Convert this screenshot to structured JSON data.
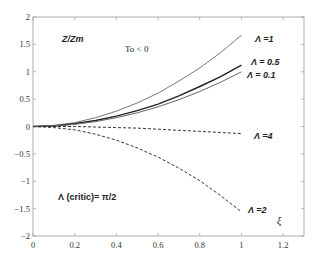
{
  "chart_data": {
    "type": "line",
    "title": "",
    "xlabel": "ξ",
    "ylabel": "Z/Zm",
    "xlim": [
      0,
      1.3
    ],
    "ylim": [
      -2,
      2
    ],
    "xticks": [
      "0",
      "0.2",
      "0.4",
      "0.6",
      "0.8",
      "1",
      "1.2"
    ],
    "yticks": [
      "2",
      "1.5",
      "1",
      "0.5",
      "0",
      "-0.5",
      "-1",
      "-1.5",
      "-2"
    ],
    "grid": false,
    "annotations": [
      "To < 0",
      "Λ (critic)= π/2"
    ],
    "x": [
      0,
      0.1,
      0.2,
      0.3,
      0.4,
      0.5,
      0.6,
      0.7,
      0.8,
      0.9,
      1.0
    ],
    "series": [
      {
        "name": "Λ =1",
        "style": "solid",
        "values": [
          0,
          0.02,
          0.07,
          0.16,
          0.28,
          0.43,
          0.61,
          0.83,
          1.07,
          1.35,
          1.67
        ]
      },
      {
        "name": "Λ = 0.5",
        "style": "solid",
        "values": [
          0,
          0.01,
          0.05,
          0.11,
          0.19,
          0.29,
          0.41,
          0.56,
          0.73,
          0.91,
          1.12
        ]
      },
      {
        "name": "Λ = 0.1",
        "style": "solid",
        "values": [
          0,
          0.01,
          0.04,
          0.09,
          0.16,
          0.25,
          0.36,
          0.49,
          0.64,
          0.81,
          1.0
        ]
      },
      {
        "name": "Λ =4",
        "style": "dashed",
        "values": [
          0,
          0.0,
          0.0,
          -0.01,
          -0.02,
          -0.03,
          -0.05,
          -0.07,
          -0.09,
          -0.11,
          -0.13
        ]
      },
      {
        "name": "Λ =2",
        "style": "dashed",
        "values": [
          0,
          -0.02,
          -0.06,
          -0.14,
          -0.25,
          -0.39,
          -0.56,
          -0.76,
          -0.99,
          -1.26,
          -1.56
        ]
      }
    ]
  },
  "labels": {
    "ylabel": "Z/Zm",
    "xlabel": "ξ",
    "condition": "To < 0",
    "critic": "Λ (critic)= π/2",
    "l1": "Λ =1",
    "l05": "Λ = 0.5",
    "l01": "Λ = 0.1",
    "l4": "Λ =4",
    "l2": "Λ =2"
  }
}
